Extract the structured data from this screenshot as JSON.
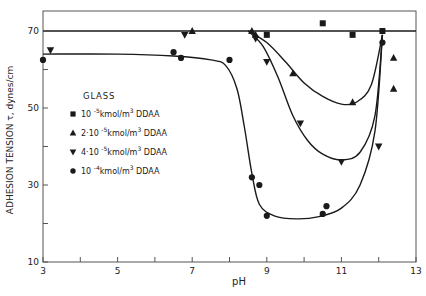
{
  "chart_data": {
    "type": "scatter",
    "title": "",
    "xlabel": "pH",
    "ylabel": "ADHESION TENSION  τ,  dynes/cm",
    "xlim": [
      3,
      13
    ],
    "ylim": [
      10,
      75
    ],
    "x_ticks": [
      3,
      5,
      7,
      9,
      11,
      13
    ],
    "x_minor_ticks": [
      4,
      6,
      8,
      10,
      12
    ],
    "y_ticks": [
      10,
      30,
      50,
      70
    ],
    "y_minor_ticks": [
      20,
      40,
      60
    ],
    "grid": false,
    "legend_title": "GLASS",
    "legend_position": "upper-left inside",
    "reference_line": {
      "y": 70
    },
    "series": [
      {
        "name": "10⁻⁵ kmol/m³ DDAA",
        "label_prefix": "10",
        "label_exp": "-5",
        "label_suffix": "kmol/m",
        "marker": "square",
        "points": [
          [
            9.0,
            69
          ],
          [
            10.5,
            72
          ],
          [
            11.3,
            69
          ],
          [
            12.1,
            70
          ]
        ],
        "curve": [
          [
            8.4,
            70
          ],
          [
            12.1,
            70
          ]
        ]
      },
      {
        "name": "2·10⁻⁵ kmol/m³ DDAA",
        "label_prefix": "2·10",
        "label_exp": "-5",
        "label_suffix": "kmol/m",
        "marker": "triangle-up",
        "points": [
          [
            7.0,
            70
          ],
          [
            8.6,
            70
          ],
          [
            8.7,
            69
          ],
          [
            9.7,
            59
          ],
          [
            11.3,
            51.5
          ],
          [
            12.4,
            63
          ],
          [
            12.4,
            55
          ]
        ],
        "curve": [
          [
            8.5,
            70
          ],
          [
            9.0,
            67
          ],
          [
            9.5,
            62
          ],
          [
            10.0,
            56.5
          ],
          [
            10.5,
            53
          ],
          [
            11.0,
            51
          ],
          [
            11.4,
            51.5
          ],
          [
            11.8,
            56
          ],
          [
            12.1,
            69
          ]
        ]
      },
      {
        "name": "4·10⁻⁵ kmol/m³ DDAA",
        "label_prefix": "4·10",
        "label_exp": "-5",
        "label_suffix": "kmol/m",
        "marker": "triangle-down",
        "points": [
          [
            3.2,
            65
          ],
          [
            6.8,
            69
          ],
          [
            8.7,
            68
          ],
          [
            9.0,
            62
          ],
          [
            9.9,
            46
          ],
          [
            11.0,
            36
          ],
          [
            12.0,
            40
          ]
        ],
        "curve": [
          [
            8.5,
            70
          ],
          [
            8.9,
            66
          ],
          [
            9.3,
            58
          ],
          [
            9.7,
            48
          ],
          [
            10.1,
            41.5
          ],
          [
            10.5,
            38
          ],
          [
            11.0,
            36.5
          ],
          [
            11.5,
            38.5
          ],
          [
            11.9,
            48
          ],
          [
            12.1,
            69
          ]
        ]
      },
      {
        "name": "10⁻⁴ kmol/m³ DDAA",
        "label_prefix": "10",
        "label_exp": "-4",
        "label_suffix": "kmol/m",
        "marker": "circle",
        "points": [
          [
            3.0,
            62.5
          ],
          [
            6.5,
            64.5
          ],
          [
            6.7,
            63
          ],
          [
            8.0,
            62.5
          ],
          [
            8.6,
            32
          ],
          [
            8.8,
            30
          ],
          [
            9.0,
            22
          ],
          [
            10.5,
            22.5
          ],
          [
            10.6,
            24.5
          ],
          [
            12.1,
            67
          ]
        ],
        "curve": [
          [
            3.0,
            64
          ],
          [
            5.0,
            64
          ],
          [
            6.5,
            63.5
          ],
          [
            7.5,
            62.5
          ],
          [
            7.9,
            61
          ],
          [
            8.2,
            55
          ],
          [
            8.4,
            45
          ],
          [
            8.6,
            33
          ],
          [
            8.8,
            25
          ],
          [
            9.2,
            22
          ],
          [
            9.8,
            21.2
          ],
          [
            10.4,
            21.8
          ],
          [
            11.0,
            24
          ],
          [
            11.5,
            30
          ],
          [
            11.9,
            44
          ],
          [
            12.1,
            69
          ]
        ]
      }
    ]
  },
  "legend": {
    "title": "GLASS",
    "items": [
      {
        "prefix": "10",
        "exp": "-5",
        "unit": "kmol/m",
        "unit_exp": "3",
        "suffix": "DDAA"
      },
      {
        "prefix": "2·10",
        "exp": "-5",
        "unit": "kmol/m",
        "unit_exp": "3",
        "suffix": "DDAA"
      },
      {
        "prefix": "4·10",
        "exp": "-5",
        "unit": "kmol/m",
        "unit_exp": "3",
        "suffix": "DDAA"
      },
      {
        "prefix": "10",
        "exp": "-4",
        "unit": "kmol/m",
        "unit_exp": "3",
        "suffix": "DDAA"
      }
    ]
  },
  "colors": {
    "ink": "#1a1a1a",
    "background": "#ffffff",
    "frame": "#555555"
  }
}
